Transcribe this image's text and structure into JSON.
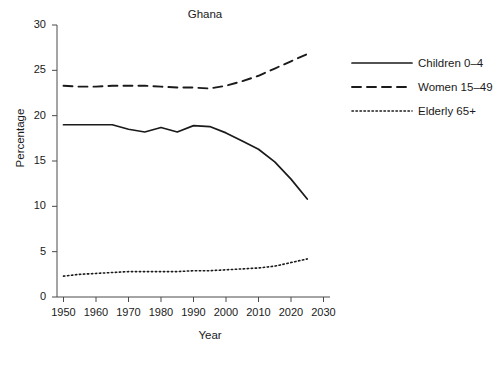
{
  "chart_data": {
    "type": "line",
    "title": "Ghana",
    "xlabel": "Year",
    "ylabel": "Percentage",
    "xlim": [
      1948,
      2032
    ],
    "ylim": [
      0,
      30
    ],
    "xticks": [
      1950,
      1960,
      1970,
      1980,
      1990,
      2000,
      2010,
      2020,
      2030
    ],
    "yticks": [
      0,
      5,
      10,
      15,
      20,
      25,
      30
    ],
    "grid": false,
    "legend_position": "right",
    "series": [
      {
        "name": "Children 0–4",
        "style": "solid",
        "color": "#1a1a1a",
        "x": [
          1950,
          1955,
          1960,
          1965,
          1970,
          1975,
          1980,
          1985,
          1990,
          1995,
          2000,
          2005,
          2010,
          2015,
          2020,
          2025
        ],
        "values": [
          19.0,
          19.0,
          19.0,
          19.0,
          18.5,
          18.2,
          18.7,
          18.2,
          18.9,
          18.8,
          18.1,
          17.2,
          16.3,
          14.9,
          13.0,
          10.8
        ]
      },
      {
        "name": "Women 15–49",
        "style": "dashed",
        "color": "#1a1a1a",
        "x": [
          1950,
          1955,
          1960,
          1965,
          1970,
          1975,
          1980,
          1985,
          1990,
          1995,
          2000,
          2005,
          2010,
          2015,
          2020,
          2025
        ],
        "values": [
          23.3,
          23.2,
          23.2,
          23.3,
          23.3,
          23.3,
          23.2,
          23.1,
          23.1,
          23.0,
          23.3,
          23.8,
          24.4,
          25.2,
          26.0,
          26.8
        ]
      },
      {
        "name": "Elderly 65+",
        "style": "dotted",
        "color": "#1a1a1a",
        "x": [
          1950,
          1955,
          1960,
          1965,
          1970,
          1975,
          1980,
          1985,
          1990,
          1995,
          2000,
          2005,
          2010,
          2015,
          2020,
          2025
        ],
        "values": [
          2.3,
          2.5,
          2.6,
          2.7,
          2.8,
          2.8,
          2.8,
          2.8,
          2.9,
          2.9,
          3.0,
          3.1,
          3.2,
          3.4,
          3.8,
          4.2
        ]
      }
    ]
  },
  "legend": {
    "items": [
      {
        "label": "Children 0–4",
        "style": "solid"
      },
      {
        "label": "Women 15–49",
        "style": "dashed"
      },
      {
        "label": "Elderly 65+",
        "style": "dotted"
      }
    ]
  }
}
